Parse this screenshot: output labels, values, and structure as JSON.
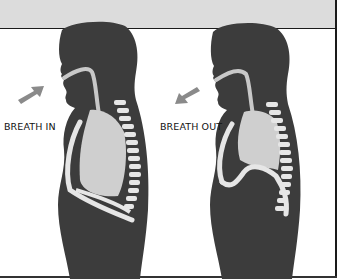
{
  "diagram": {
    "panels": [
      {
        "label": "BREATH IN",
        "arrow_direction": "toward-mouth",
        "diaphragm_state": "flattened-down",
        "lung_state": "expanded"
      },
      {
        "label": "BREATH OUT",
        "arrow_direction": "away-from-mouth",
        "diaphragm_state": "domed-up",
        "lung_state": "contracted"
      }
    ],
    "colors": {
      "band": "#dcdcdc",
      "body": "#3c3c3c",
      "airway": "#c8c8c8",
      "lung": "#cfcfcf",
      "bone": "#e6e6e6",
      "arrow": "#8a8a8a",
      "frame": "#1a1a1a"
    }
  }
}
